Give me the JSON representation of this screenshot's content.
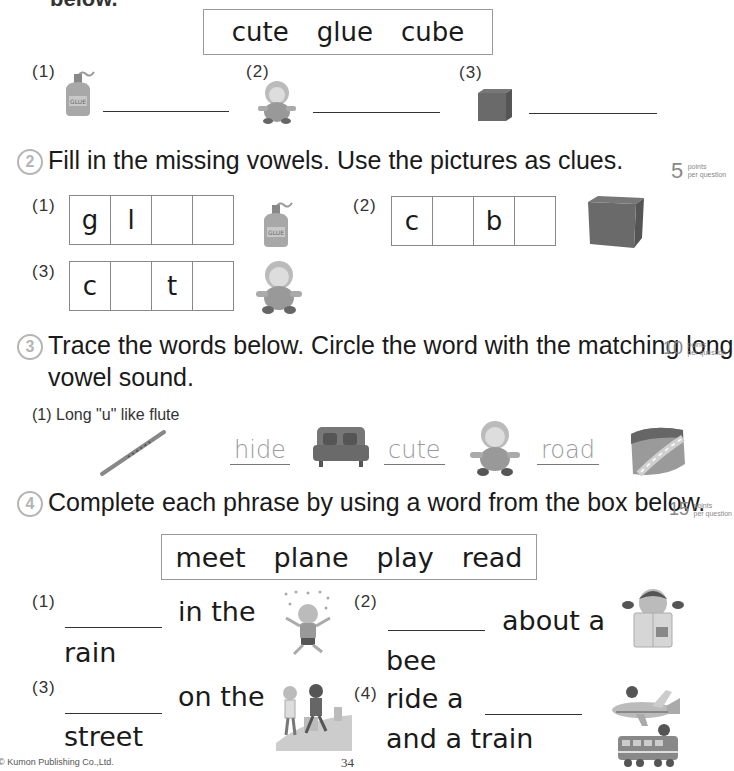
{
  "header_fragment": "below.",
  "section1": {
    "word_box": [
      "cute",
      "glue",
      "cube"
    ],
    "items": [
      {
        "number": "(1)",
        "picture": "glue-bottle",
        "picture_label": "GLUE"
      },
      {
        "number": "(2)",
        "picture": "baby-doll"
      },
      {
        "number": "(3)",
        "picture": "cube"
      }
    ]
  },
  "section2": {
    "number": "2",
    "instruction": "Fill in the missing vowels. Use the pictures as clues.",
    "points_value": "5",
    "points_unit": "points",
    "points_per": "per question",
    "items": [
      {
        "number": "(1)",
        "cells": [
          "g",
          "l",
          "",
          ""
        ],
        "picture": "glue-bottle",
        "picture_label": "GLUE"
      },
      {
        "number": "(2)",
        "cells": [
          "c",
          "",
          "b",
          ""
        ],
        "picture": "cube"
      },
      {
        "number": "(3)",
        "cells": [
          "c",
          "",
          "t",
          ""
        ],
        "picture": "baby-doll"
      }
    ]
  },
  "section3": {
    "number": "3",
    "instruction_line1": "Trace the words below. Circle the word with the matching long",
    "instruction_line2": "vowel sound.",
    "points_value": "10",
    "points_unit": "points",
    "points_per": "per question",
    "items": [
      {
        "number": "(1)",
        "prompt": "Long \"u\" like flute",
        "prompt_picture": "flute",
        "choices": [
          {
            "word": "hide",
            "picture": "couch"
          },
          {
            "word": "cute",
            "picture": "baby-doll"
          },
          {
            "word": "road",
            "picture": "road"
          }
        ]
      }
    ]
  },
  "section4": {
    "number": "4",
    "instruction": "Complete each phrase by using a word from the box below.",
    "points_value": "15",
    "points_unit": "points",
    "points_per": "per question",
    "word_box": [
      "meet",
      "plane",
      "play",
      "read"
    ],
    "items": [
      {
        "number": "(1)",
        "line1_after_blank": "in the",
        "line2": "rain",
        "picture": "child-in-rain"
      },
      {
        "number": "(2)",
        "line1_after_blank": "about a",
        "line2": "bee",
        "picture": "girl-reading-book"
      },
      {
        "number": "(3)",
        "line1_after_blank": "on the",
        "line2": "street",
        "picture": "two-boys-on-street"
      },
      {
        "number": "(4)",
        "line1_before_blank": "ride a",
        "line2": "and a train",
        "picture": "plane-and-train"
      }
    ]
  },
  "footer": {
    "copyright": "© Kumon Publishing Co.,Ltd.",
    "page_number": "34"
  }
}
